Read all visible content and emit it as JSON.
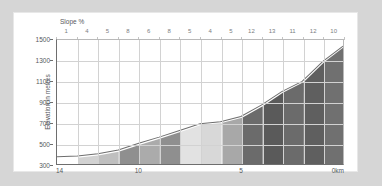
{
  "chart_data": {
    "type": "area",
    "title": "",
    "xlabel": "",
    "ylabel": "Elevation in metres",
    "slope_header": "Slope %",
    "distance_unit": "0km",
    "xlim": [
      14,
      0
    ],
    "ylim": [
      300,
      1500
    ],
    "y_ticks": [
      1500,
      1300,
      1100,
      900,
      700,
      500,
      300
    ],
    "x_ticks": [
      {
        "value": 14,
        "label": "14"
      },
      {
        "value": 10,
        "label": "10"
      },
      {
        "value": 5,
        "label": "5"
      },
      {
        "value": 0,
        "label": "0km"
      }
    ],
    "grid": true,
    "legend": "none",
    "km_segments": [
      {
        "from_km": 14,
        "to_km": 13,
        "slope_percent": 1,
        "color": "#ffffff"
      },
      {
        "from_km": 13,
        "to_km": 12,
        "slope_percent": 4,
        "color": "#d2d2d2"
      },
      {
        "from_km": 12,
        "to_km": 11,
        "slope_percent": 5,
        "color": "#bfbfbf"
      },
      {
        "from_km": 11,
        "to_km": 10,
        "slope_percent": 8,
        "color": "#8f8f8f"
      },
      {
        "from_km": 10,
        "to_km": 9,
        "slope_percent": 6,
        "color": "#ababab"
      },
      {
        "from_km": 9,
        "to_km": 8,
        "slope_percent": 8,
        "color": "#8f8f8f"
      },
      {
        "from_km": 8,
        "to_km": 7,
        "slope_percent": 5,
        "color": "#e2e2e2"
      },
      {
        "from_km": 7,
        "to_km": 6,
        "slope_percent": 4,
        "color": "#d8d8d8"
      },
      {
        "from_km": 6,
        "to_km": 5,
        "slope_percent": 5,
        "color": "#a8a8a8"
      },
      {
        "from_km": 5,
        "to_km": 4,
        "slope_percent": 12,
        "color": "#6b6b6b"
      },
      {
        "from_km": 4,
        "to_km": 3,
        "slope_percent": 13,
        "color": "#5a5a5a"
      },
      {
        "from_km": 3,
        "to_km": 2,
        "slope_percent": 11,
        "color": "#6b6b6b"
      },
      {
        "from_km": 2,
        "to_km": 1,
        "slope_percent": 12,
        "color": "#5f5f5f"
      },
      {
        "from_km": 1,
        "to_km": 0,
        "slope_percent": 10,
        "color": "#707070"
      }
    ],
    "profile_points": [
      {
        "km": 14,
        "elevation": 370
      },
      {
        "km": 13,
        "elevation": 378
      },
      {
        "km": 12,
        "elevation": 400
      },
      {
        "km": 11,
        "elevation": 435
      },
      {
        "km": 10,
        "elevation": 500
      },
      {
        "km": 9,
        "elevation": 560
      },
      {
        "km": 8,
        "elevation": 625
      },
      {
        "km": 7,
        "elevation": 690
      },
      {
        "km": 6,
        "elevation": 710
      },
      {
        "km": 5,
        "elevation": 760
      },
      {
        "km": 4,
        "elevation": 870
      },
      {
        "km": 3,
        "elevation": 1000
      },
      {
        "km": 2,
        "elevation": 1100
      },
      {
        "km": 1,
        "elevation": 1290
      },
      {
        "km": 0,
        "elevation": 1440
      }
    ],
    "line_color": "#6e6e6e"
  }
}
